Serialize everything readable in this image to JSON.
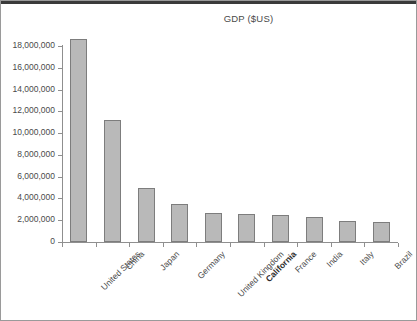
{
  "chart_data": {
    "type": "bar",
    "title": "GDP ($US)",
    "xlabel": "",
    "ylabel": "",
    "ylim": [
      0,
      18000000
    ],
    "ytick_step": 2000000,
    "ytick_labels": [
      "18,000,000",
      "16,000,000",
      "14,000,000",
      "12,000,000",
      "10,000,000",
      "8,000,000",
      "6,000,000",
      "4,000,000",
      "2,000,000",
      "0"
    ],
    "ytick_values": [
      18000000,
      16000000,
      14000000,
      12000000,
      10000000,
      8000000,
      6000000,
      4000000,
      2000000,
      0
    ],
    "grid": false,
    "legend": false,
    "categories": [
      "United States",
      "China",
      "Japan",
      "Germany",
      "United Kingdom",
      "California",
      "France",
      "India",
      "Italy",
      "Brazil"
    ],
    "values": [
      18600000,
      11200000,
      4950000,
      3500000,
      2650000,
      2550000,
      2500000,
      2300000,
      1900000,
      1850000
    ],
    "emphasized_categories": [
      "California"
    ],
    "bar_fill_color": "#b9b9b9",
    "bar_border_color": "#7d7d7d",
    "axis_color": "#8f8f8f",
    "text_color": "#4a4a4a"
  }
}
